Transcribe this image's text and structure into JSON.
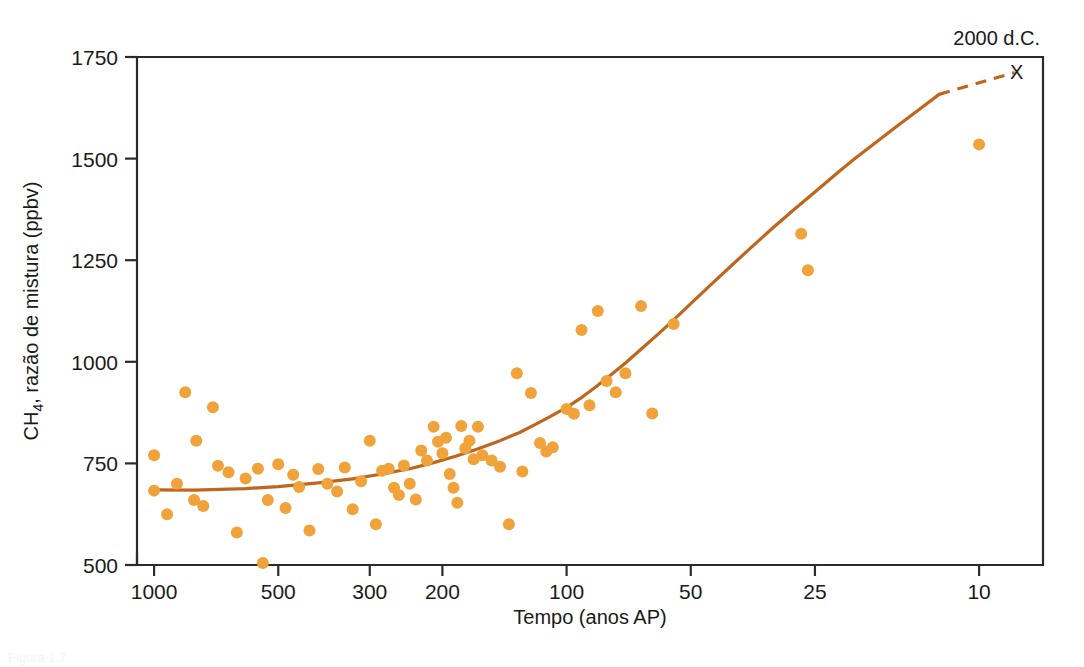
{
  "figure": {
    "background": "#ffffff",
    "caption_partial": "Figura 1.7"
  },
  "chart_data": {
    "type": "scatter",
    "title": "",
    "xlabel": "Tempo (anos AP)",
    "ylabel": "CH4, razão de mistura (ppbv)",
    "ylabel_main": "CH",
    "ylabel_sub": "4",
    "ylabel_rest": ", razão de mistura (ppbv)",
    "xscale": "log",
    "x_reversed": true,
    "xlim": [
      1100,
      7
    ],
    "ylim": [
      500,
      1750
    ],
    "xticks": [
      1000,
      500,
      300,
      200,
      100,
      50,
      25,
      10
    ],
    "xticklabels": [
      "1000",
      "500",
      "300",
      "200",
      "100",
      "50",
      "25",
      "10"
    ],
    "yticks": [
      500,
      750,
      1000,
      1250,
      1500,
      1750
    ],
    "yticklabels": [
      "500",
      "750",
      "1000",
      "1250",
      "1500",
      "1750"
    ],
    "grid": false,
    "legend": null,
    "colors": {
      "points": "#efa33a",
      "trend_line": "#c0661c",
      "dashed_extension": "#c0661c",
      "axis": "#2b2b2b",
      "text": "#1a1a1a"
    },
    "point_radius": 6,
    "annotations": [
      {
        "name": "year-2000-label",
        "text": "2000 d.C.",
        "x": 10,
        "y": 1750,
        "position": "above-top-right"
      },
      {
        "name": "x-marker",
        "text": "X",
        "x": 8.2,
        "y": 1710,
        "position": "inside-top-right"
      }
    ],
    "series": [
      {
        "name": "CH4 medições em testemunhos de gelo",
        "marker": "circle",
        "color": "#efa33a",
        "points": [
          [
            1000,
            770
          ],
          [
            1000,
            683
          ],
          [
            930,
            625
          ],
          [
            880,
            700
          ],
          [
            840,
            925
          ],
          [
            800,
            660
          ],
          [
            790,
            806
          ],
          [
            760,
            645
          ],
          [
            720,
            888
          ],
          [
            700,
            744
          ],
          [
            660,
            728
          ],
          [
            630,
            580
          ],
          [
            600,
            713
          ],
          [
            560,
            737
          ],
          [
            545,
            505
          ],
          [
            530,
            660
          ],
          [
            500,
            748
          ],
          [
            480,
            640
          ],
          [
            460,
            722
          ],
          [
            445,
            692
          ],
          [
            420,
            585
          ],
          [
            400,
            736
          ],
          [
            380,
            700
          ],
          [
            360,
            681
          ],
          [
            345,
            740
          ],
          [
            330,
            637
          ],
          [
            315,
            706
          ],
          [
            300,
            806
          ],
          [
            290,
            600
          ],
          [
            280,
            732
          ],
          [
            270,
            737
          ],
          [
            262,
            690
          ],
          [
            255,
            672
          ],
          [
            248,
            745
          ],
          [
            240,
            700
          ],
          [
            232,
            661
          ],
          [
            225,
            782
          ],
          [
            218,
            757
          ],
          [
            210,
            840
          ],
          [
            205,
            803
          ],
          [
            200,
            775
          ],
          [
            196,
            813
          ],
          [
            192,
            724
          ],
          [
            188,
            690
          ],
          [
            184,
            653
          ],
          [
            180,
            842
          ],
          [
            176,
            787
          ],
          [
            172,
            806
          ],
          [
            168,
            760
          ],
          [
            164,
            840
          ],
          [
            160,
            770
          ],
          [
            152,
            757
          ],
          [
            145,
            742
          ],
          [
            138,
            600
          ],
          [
            132,
            972
          ],
          [
            128,
            730
          ],
          [
            122,
            923
          ],
          [
            116,
            800
          ],
          [
            112,
            779
          ],
          [
            108,
            790
          ],
          [
            100,
            884
          ],
          [
            96,
            872
          ],
          [
            92,
            1078
          ],
          [
            88,
            893
          ],
          [
            84,
            1125
          ],
          [
            80,
            953
          ],
          [
            76,
            925
          ],
          [
            72,
            972
          ],
          [
            66,
            1137
          ],
          [
            62,
            873
          ],
          [
            55,
            1093
          ],
          [
            27,
            1315
          ],
          [
            26,
            1225
          ],
          [
            10,
            1535
          ]
        ]
      }
    ],
    "trend_line": {
      "name": "curva de tendência ajustada",
      "color": "#c0661c",
      "style": "solid",
      "points": [
        [
          1000,
          685
        ],
        [
          800,
          684
        ],
        [
          600,
          688
        ],
        [
          500,
          693
        ],
        [
          400,
          702
        ],
        [
          330,
          712
        ],
        [
          280,
          724
        ],
        [
          240,
          737
        ],
        [
          210,
          752
        ],
        [
          185,
          768
        ],
        [
          165,
          785
        ],
        [
          145,
          806
        ],
        [
          130,
          826
        ],
        [
          118,
          848
        ],
        [
          108,
          869
        ],
        [
          100,
          888
        ],
        [
          92,
          912
        ],
        [
          85,
          938
        ],
        [
          78,
          968
        ],
        [
          72,
          997
        ],
        [
          66,
          1031
        ],
        [
          60,
          1068
        ],
        [
          55,
          1103
        ],
        [
          50,
          1143
        ],
        [
          45,
          1187
        ],
        [
          40,
          1235
        ],
        [
          36,
          1278
        ],
        [
          32,
          1325
        ],
        [
          28,
          1376
        ],
        [
          25,
          1418
        ],
        [
          22,
          1466
        ],
        [
          20,
          1500
        ],
        [
          18,
          1536
        ],
        [
          16,
          1576
        ],
        [
          14,
          1620
        ],
        [
          12.5,
          1658
        ]
      ],
      "dashed_segment": {
        "color": "#c0661c",
        "style": "dashed",
        "from": [
          12.5,
          1658
        ],
        "to": [
          8.2,
          1712
        ]
      }
    }
  }
}
